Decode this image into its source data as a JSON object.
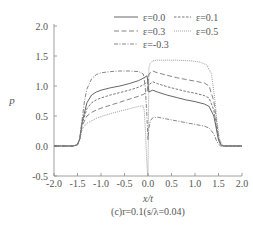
{
  "chart_data": {
    "type": "line",
    "title": "",
    "caption": "(c)r=0.1(s/λ=0.04)",
    "xlabel": "x/t",
    "ylabel": "p",
    "xlim": [
      -2.0,
      2.0
    ],
    "ylim": [
      -0.5,
      2.0
    ],
    "xticks": [
      "-2.0",
      "-1.5",
      "-1.0",
      "-0.5",
      "0.0",
      "0.5",
      "1.0",
      "1.5",
      "2.0"
    ],
    "yticks": [
      "-0.5",
      "0.0",
      "0.5",
      "1.0",
      "1.5",
      "2.0"
    ],
    "grid": false,
    "legend_position": "upper-right",
    "series": [
      {
        "name": "ε=0.0",
        "style": "solid",
        "x": [
          -2.0,
          -1.6,
          -1.5,
          -1.45,
          -1.4,
          -1.3,
          -1.2,
          -1.1,
          -1.0,
          -0.8,
          -0.6,
          -0.4,
          -0.2,
          -0.1,
          -0.02,
          0.02,
          0.1,
          0.2,
          0.4,
          0.6,
          0.8,
          1.0,
          1.2,
          1.3,
          1.4,
          1.45,
          1.5,
          1.55,
          1.6,
          2.0
        ],
        "y": [
          0.0,
          0.0,
          0.02,
          0.12,
          0.4,
          0.72,
          0.85,
          0.9,
          0.93,
          0.97,
          1.0,
          1.04,
          1.09,
          1.13,
          1.17,
          0.9,
          0.93,
          0.9,
          0.85,
          0.81,
          0.77,
          0.74,
          0.7,
          0.66,
          0.5,
          0.3,
          0.1,
          0.02,
          0.0,
          0.0
        ]
      },
      {
        "name": "ε=0.1",
        "style": "dashed-short",
        "x": [
          -2.0,
          -1.6,
          -1.5,
          -1.45,
          -1.4,
          -1.3,
          -1.2,
          -1.1,
          -1.0,
          -0.8,
          -0.6,
          -0.4,
          -0.2,
          -0.1,
          -0.02,
          0.02,
          0.1,
          0.2,
          0.4,
          0.6,
          0.8,
          1.0,
          1.2,
          1.3,
          1.4,
          1.45,
          1.5,
          1.55,
          1.6,
          2.0
        ],
        "y": [
          0.0,
          0.0,
          0.02,
          0.12,
          0.38,
          0.62,
          0.72,
          0.77,
          0.8,
          0.85,
          0.89,
          0.93,
          0.98,
          1.02,
          1.06,
          1.02,
          1.07,
          1.04,
          0.99,
          0.95,
          0.91,
          0.88,
          0.84,
          0.8,
          0.6,
          0.35,
          0.12,
          0.02,
          0.0,
          0.0
        ]
      },
      {
        "name": "ε=0.3",
        "style": "dashed-long",
        "x": [
          -2.0,
          -1.6,
          -1.5,
          -1.45,
          -1.4,
          -1.3,
          -1.2,
          -1.1,
          -1.0,
          -0.8,
          -0.6,
          -0.4,
          -0.2,
          -0.1,
          -0.02,
          0.02,
          0.1,
          0.2,
          0.4,
          0.6,
          0.8,
          1.0,
          1.2,
          1.3,
          1.4,
          1.45,
          1.5,
          1.55,
          1.6,
          2.0
        ],
        "y": [
          0.0,
          0.0,
          0.02,
          0.12,
          0.34,
          0.5,
          0.56,
          0.6,
          0.63,
          0.68,
          0.73,
          0.78,
          0.83,
          0.86,
          0.9,
          1.2,
          1.25,
          1.22,
          1.18,
          1.14,
          1.11,
          1.08,
          1.05,
          1.0,
          0.75,
          0.45,
          0.15,
          0.03,
          0.0,
          0.0
        ]
      },
      {
        "name": "ε=0.5",
        "style": "dotted",
        "x": [
          -2.0,
          -1.6,
          -1.5,
          -1.45,
          -1.4,
          -1.3,
          -1.2,
          -1.1,
          -1.0,
          -0.8,
          -0.6,
          -0.4,
          -0.2,
          -0.1,
          -0.08,
          -0.05,
          -0.03,
          -0.01,
          0.0,
          0.02,
          0.05,
          0.1,
          0.2,
          0.3,
          0.6,
          0.9,
          1.1,
          1.25,
          1.35,
          1.42,
          1.47,
          1.52,
          1.57,
          1.62,
          2.0
        ],
        "y": [
          0.0,
          0.0,
          0.02,
          0.1,
          0.28,
          0.38,
          0.42,
          0.46,
          0.49,
          0.54,
          0.58,
          0.62,
          0.66,
          0.67,
          0.6,
          0.2,
          -0.2,
          -0.45,
          -0.5,
          1.3,
          1.38,
          1.42,
          1.43,
          1.43,
          1.43,
          1.42,
          1.4,
          1.35,
          1.2,
          0.8,
          0.4,
          0.12,
          0.03,
          0.0,
          0.0
        ]
      },
      {
        "name": "ε=-0.3",
        "style": "dash-dot",
        "x": [
          -2.0,
          -1.6,
          -1.5,
          -1.45,
          -1.4,
          -1.35,
          -1.3,
          -1.2,
          -1.1,
          -1.0,
          -0.8,
          -0.6,
          -0.4,
          -0.2,
          -0.1,
          -0.06,
          -0.03,
          0.0,
          0.02,
          0.05,
          0.1,
          0.2,
          0.4,
          0.6,
          0.8,
          1.0,
          1.2,
          1.3,
          1.4,
          1.45,
          1.5,
          1.55,
          1.6,
          2.0
        ],
        "y": [
          0.0,
          0.0,
          0.02,
          0.14,
          0.45,
          0.75,
          0.95,
          1.12,
          1.19,
          1.22,
          1.24,
          1.25,
          1.25,
          1.24,
          1.2,
          1.0,
          0.6,
          0.1,
          0.3,
          0.42,
          0.47,
          0.48,
          0.45,
          0.42,
          0.39,
          0.36,
          0.33,
          0.3,
          0.2,
          0.1,
          0.03,
          0.0,
          0.0,
          0.0
        ]
      }
    ]
  },
  "styles": {
    "axis_color": "#888888",
    "text_color": "#555555",
    "series_colors": {
      "ε=0.0": "#555555",
      "ε=0.1": "#666666",
      "ε=0.3": "#777777",
      "ε=0.5": "#888888",
      "ε=-0.3": "#777777"
    }
  }
}
